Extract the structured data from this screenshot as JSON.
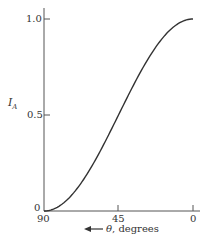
{
  "chart_data": {
    "type": "line",
    "title": "",
    "xlabel": "θ, degrees",
    "xlabel_arrow": "←",
    "ylabel": "I",
    "ylabel_subscript": "A",
    "x_ticks": [
      "90",
      "45",
      "0"
    ],
    "y_ticks": [
      "0",
      "0.5",
      "1.0"
    ],
    "xlim": [
      90,
      0
    ],
    "ylim": [
      0,
      1.0
    ],
    "grid": false,
    "legend": null,
    "series": [
      {
        "name": "I_A = cos²θ",
        "x": [
          90,
          80,
          70,
          60,
          50,
          45,
          40,
          30,
          20,
          10,
          0
        ],
        "y": [
          0.0,
          0.03,
          0.117,
          0.25,
          0.413,
          0.5,
          0.587,
          0.75,
          0.883,
          0.97,
          1.0
        ]
      }
    ]
  }
}
